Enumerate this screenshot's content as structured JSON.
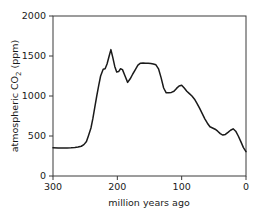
{
  "chart_data": {
    "type": "line",
    "title": "",
    "xlabel": "million years ago",
    "ylabel": "atmospheric CO2 (ppm)",
    "ylabel_parts": {
      "prefix": "atmospheric CO",
      "subscript": "2",
      "suffix": " (ppm)"
    },
    "xlim": [
      300,
      0
    ],
    "ylim": [
      0,
      2000
    ],
    "x_reversed": true,
    "grid": false,
    "legend": null,
    "line_color": "#1a1a1a",
    "line_width": 1.5,
    "xticks": [
      300,
      200,
      100,
      0
    ],
    "xtick_labels": [
      "300",
      "200",
      "100",
      "0"
    ],
    "yticks": [
      0,
      500,
      1000,
      1500,
      2000
    ],
    "ytick_labels": [
      "0",
      "500",
      "1000",
      "1500",
      "2000"
    ],
    "series": [
      {
        "name": "atmospheric CO2",
        "x": [
          300,
          292,
          285,
          278,
          272,
          266,
          261,
          256,
          252,
          248,
          245,
          241,
          238,
          235,
          232,
          229,
          226,
          222,
          219,
          216,
          213,
          210,
          207,
          204,
          201,
          198,
          195,
          192,
          188,
          184,
          180,
          176,
          172,
          168,
          164,
          160,
          156,
          152,
          148,
          144,
          140,
          136,
          132,
          128,
          124,
          120,
          116,
          112,
          108,
          104,
          100,
          96,
          92,
          88,
          84,
          80,
          76,
          72,
          68,
          64,
          60,
          56,
          52,
          48,
          44,
          40,
          36,
          32,
          28,
          24,
          20,
          16,
          12,
          8,
          4,
          0
        ],
        "y": [
          352,
          351,
          350,
          350,
          352,
          356,
          362,
          372,
          392,
          430,
          500,
          600,
          720,
          860,
          1000,
          1130,
          1250,
          1335,
          1340,
          1400,
          1490,
          1580,
          1480,
          1370,
          1300,
          1305,
          1340,
          1330,
          1250,
          1170,
          1215,
          1275,
          1330,
          1385,
          1410,
          1412,
          1410,
          1408,
          1405,
          1400,
          1390,
          1340,
          1230,
          1100,
          1040,
          1042,
          1045,
          1060,
          1095,
          1125,
          1135,
          1100,
          1060,
          1030,
          1000,
          960,
          905,
          845,
          780,
          715,
          660,
          615,
          600,
          585,
          560,
          530,
          512,
          520,
          545,
          572,
          590,
          560,
          500,
          430,
          355,
          305
        ]
      }
    ],
    "annotations": {
      "peak_value": 1580,
      "peak_x": 210,
      "baseline_start": 352,
      "end_value": 305
    }
  },
  "axis": {
    "x_title": "million years ago",
    "y_title_prefix": "atmospheric CO",
    "y_title_sub": "2",
    "y_title_suffix": " (ppm)"
  }
}
